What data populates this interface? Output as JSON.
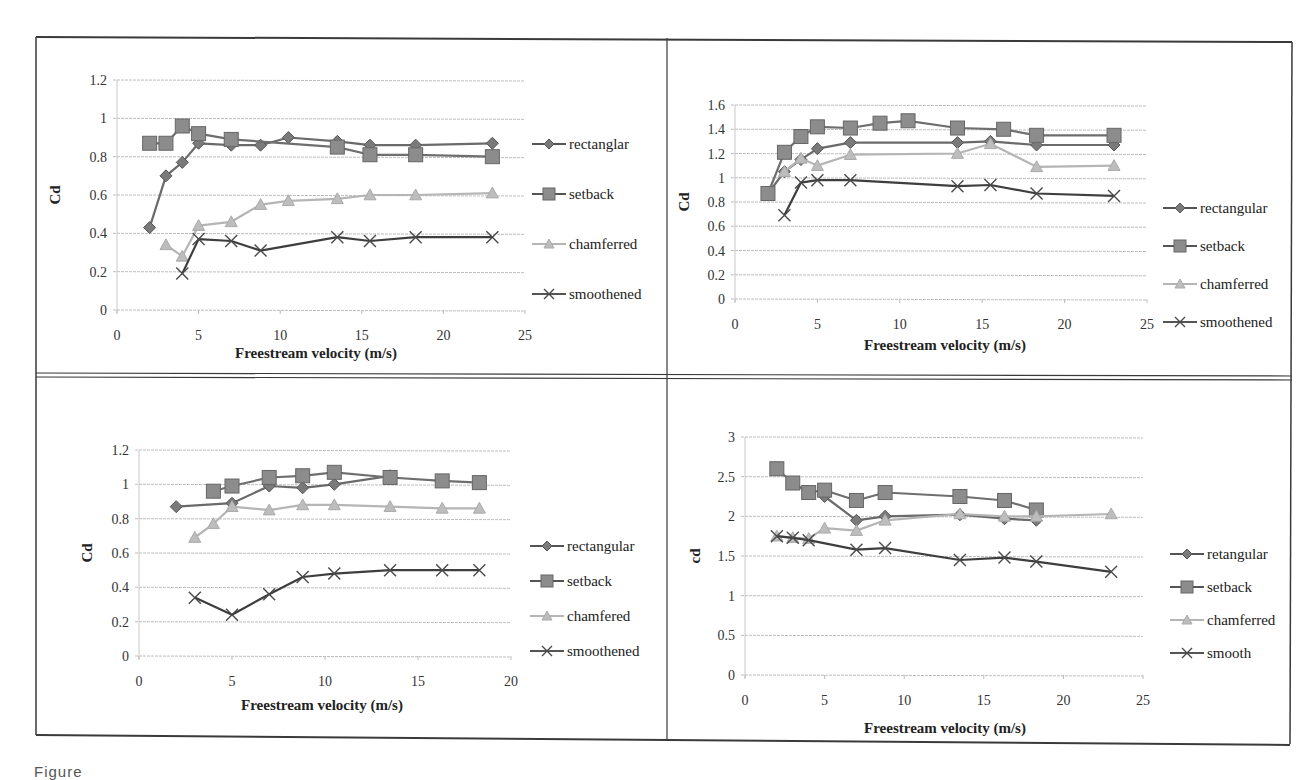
{
  "figure": {
    "caption_fragment": "Figure",
    "border_color": "#3a3a3a"
  },
  "colors": {
    "rectangular": "#7a7a7a",
    "setback": "#8c8c8c",
    "chamferred": "#bdbdbd",
    "smoothened": "#4a4a4a",
    "grid": "#bdbdbd"
  },
  "chart_data": [
    {
      "id": "top-left",
      "type": "line",
      "title": "",
      "xlabel": "Freestream velocity (m/s)",
      "ylabel": "Cd",
      "xlim": [
        0,
        25
      ],
      "ylim": [
        0,
        1.2
      ],
      "xticks": [
        "0",
        "5",
        "10",
        "15",
        "20",
        "25"
      ],
      "yticks": [
        "0",
        "0.2",
        "0.4",
        "0.6",
        "0.8",
        "1",
        "1.2"
      ],
      "grid": true,
      "legend_position": "right",
      "series": [
        {
          "name": "rectanglar",
          "marker": "diamond",
          "x": [
            2,
            3,
            4,
            5,
            7,
            8.8,
            10.5,
            13.5,
            15.5,
            18.3,
            23
          ],
          "values": [
            0.43,
            0.7,
            0.77,
            0.87,
            0.86,
            0.86,
            0.9,
            0.88,
            0.86,
            0.86,
            0.87
          ]
        },
        {
          "name": "setback",
          "marker": "square",
          "x": [
            2,
            3,
            4,
            5,
            7,
            13.5,
            15.5,
            18.3,
            23
          ],
          "values": [
            0.87,
            0.87,
            0.96,
            0.92,
            0.89,
            0.85,
            0.81,
            0.81,
            0.8
          ]
        },
        {
          "name": "chamferred",
          "marker": "triangle",
          "x": [
            3,
            4,
            5,
            7,
            8.8,
            10.5,
            13.5,
            15.5,
            18.3,
            23
          ],
          "values": [
            0.34,
            0.28,
            0.44,
            0.46,
            0.55,
            0.57,
            0.58,
            0.6,
            0.6,
            0.61
          ]
        },
        {
          "name": "smoothened",
          "marker": "x",
          "x": [
            4,
            5,
            7,
            8.8,
            13.5,
            15.5,
            18.3,
            23
          ],
          "values": [
            0.19,
            0.37,
            0.36,
            0.31,
            0.38,
            0.36,
            0.38,
            0.38
          ]
        }
      ]
    },
    {
      "id": "top-right",
      "type": "line",
      "title": "",
      "xlabel": "Freestream  velocity (m/s)",
      "ylabel": "Cd",
      "xlim": [
        0,
        25
      ],
      "ylim": [
        0,
        1.6
      ],
      "xticks": [
        "0",
        "5",
        "10",
        "15",
        "20",
        "25"
      ],
      "yticks": [
        "0",
        "0.2",
        "0.4",
        "0.6",
        "0.8",
        "1",
        "1.2",
        "1.4",
        "1.6"
      ],
      "grid": true,
      "legend_position": "right",
      "series": [
        {
          "name": "rectangular",
          "marker": "diamond",
          "x": [
            2,
            3,
            4,
            5,
            7,
            13.5,
            15.5,
            18.3,
            23
          ],
          "values": [
            0.87,
            1.05,
            1.15,
            1.24,
            1.29,
            1.29,
            1.3,
            1.27,
            1.27
          ]
        },
        {
          "name": "setback",
          "marker": "square",
          "x": [
            2,
            3,
            4,
            5,
            7,
            8.8,
            10.5,
            13.5,
            16.3,
            18.3,
            23
          ],
          "values": [
            0.87,
            1.21,
            1.34,
            1.42,
            1.41,
            1.45,
            1.47,
            1.41,
            1.4,
            1.35,
            1.35
          ]
        },
        {
          "name": "chamferred",
          "marker": "triangle",
          "x": [
            3,
            4,
            5,
            7,
            13.5,
            15.5,
            18.3,
            23
          ],
          "values": [
            1.05,
            1.16,
            1.1,
            1.19,
            1.2,
            1.28,
            1.09,
            1.1
          ]
        },
        {
          "name": "smoothened",
          "marker": "x",
          "x": [
            3,
            4,
            5,
            7,
            13.5,
            15.5,
            18.3,
            23
          ],
          "values": [
            0.69,
            0.96,
            0.98,
            0.98,
            0.93,
            0.94,
            0.87,
            0.85
          ]
        }
      ]
    },
    {
      "id": "bottom-left",
      "type": "line",
      "title": "",
      "xlabel": "Freestream  velocity (m/s)",
      "ylabel": "Cd",
      "xlim": [
        0,
        20
      ],
      "ylim": [
        0,
        1.2
      ],
      "xticks": [
        "0",
        "5",
        "10",
        "15",
        "20"
      ],
      "yticks": [
        "0",
        "0.2",
        "0.4",
        "0.6",
        "0.8",
        "1",
        "1.2"
      ],
      "grid": true,
      "legend_position": "right",
      "series": [
        {
          "name": "rectangular",
          "marker": "diamond",
          "x": [
            2,
            5,
            7,
            8.8,
            10.5,
            13.5
          ],
          "values": [
            0.87,
            0.89,
            0.99,
            0.98,
            1.0,
            1.05
          ]
        },
        {
          "name": "setback",
          "marker": "square",
          "x": [
            4,
            5,
            7,
            8.8,
            10.5,
            13.5,
            16.3,
            18.3
          ],
          "values": [
            0.96,
            0.99,
            1.04,
            1.05,
            1.07,
            1.04,
            1.02,
            1.01
          ]
        },
        {
          "name": "chamfered",
          "marker": "triangle",
          "x": [
            3,
            4,
            5,
            7,
            8.8,
            10.5,
            13.5,
            16.3,
            18.3
          ],
          "values": [
            0.69,
            0.77,
            0.87,
            0.85,
            0.88,
            0.88,
            0.87,
            0.86,
            0.86
          ]
        },
        {
          "name": "smoothened",
          "marker": "x",
          "x": [
            3,
            5,
            7,
            8.8,
            10.5,
            13.5,
            16.3,
            18.3
          ],
          "values": [
            0.34,
            0.24,
            0.36,
            0.46,
            0.48,
            0.5,
            0.5,
            0.5
          ]
        }
      ]
    },
    {
      "id": "bottom-right",
      "type": "line",
      "title": "",
      "xlabel": "Freestream  velocity (m/s)",
      "ylabel": "cd",
      "xlim": [
        0,
        25
      ],
      "ylim": [
        0,
        3
      ],
      "xticks": [
        "0",
        "5",
        "10",
        "15",
        "20",
        "25"
      ],
      "yticks": [
        "0",
        "0.5",
        "1",
        "1.5",
        "2",
        "2.5",
        "3"
      ],
      "grid": true,
      "legend_position": "right",
      "series": [
        {
          "name": "retangular",
          "marker": "diamond",
          "x": [
            5,
            7,
            8.8,
            13.5,
            16.3,
            18.3
          ],
          "values": [
            2.25,
            1.95,
            2.0,
            2.02,
            1.97,
            1.95
          ]
        },
        {
          "name": "setback",
          "marker": "square",
          "x": [
            2,
            3,
            4,
            5,
            7,
            8.8,
            13.5,
            16.3,
            18.3
          ],
          "values": [
            2.6,
            2.42,
            2.3,
            2.33,
            2.2,
            2.3,
            2.25,
            2.2,
            2.08
          ]
        },
        {
          "name": "chamferred",
          "marker": "triangle",
          "x": [
            2,
            3,
            4,
            5,
            7,
            8.8,
            13.5,
            16.3,
            18.3,
            23
          ],
          "values": [
            1.75,
            1.73,
            1.72,
            1.85,
            1.82,
            1.95,
            2.03,
            2.0,
            2.0,
            2.03
          ]
        },
        {
          "name": "smooth",
          "marker": "x",
          "x": [
            2,
            3,
            4,
            7,
            8.8,
            13.5,
            16.3,
            18.3,
            23
          ],
          "values": [
            1.75,
            1.73,
            1.7,
            1.58,
            1.6,
            1.45,
            1.48,
            1.43,
            1.3
          ]
        }
      ]
    }
  ],
  "layout": {
    "panels": [
      {
        "plot": {
          "x0": 117,
          "x1": 525,
          "y0": 310,
          "y1": 80
        },
        "ylabel_pos": [
          60,
          195
        ],
        "xlabel_pos": [
          316,
          358
        ],
        "legend": {
          "x": 532,
          "y": 144,
          "dy": 50
        }
      },
      {
        "plot": {
          "x0": 735,
          "x1": 1147,
          "y0": 299,
          "y1": 105
        },
        "ylabel_pos": [
          689,
          202
        ],
        "xlabel_pos": [
          945,
          350
        ],
        "legend": {
          "x": 1163,
          "y": 208,
          "dy": 38
        }
      },
      {
        "plot": {
          "x0": 139,
          "x1": 511,
          "y0": 656,
          "y1": 450
        },
        "ylabel_pos": [
          92,
          553
        ],
        "xlabel_pos": [
          322,
          710
        ],
        "legend": {
          "x": 530,
          "y": 546,
          "dy": 35
        }
      },
      {
        "plot": {
          "x0": 745,
          "x1": 1143,
          "y0": 675,
          "y1": 437
        },
        "ylabel_pos": [
          700,
          556
        ],
        "xlabel_pos": [
          945,
          733
        ],
        "legend": {
          "x": 1170,
          "y": 554,
          "dy": 33
        }
      }
    ]
  }
}
